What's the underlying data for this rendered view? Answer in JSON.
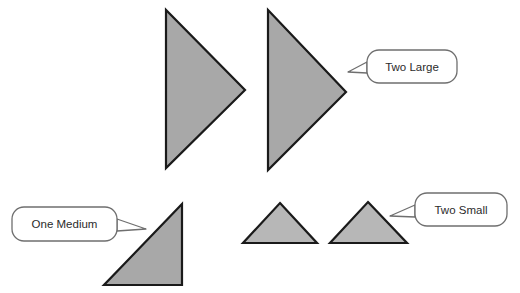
{
  "canvas": {
    "width": 520,
    "height": 293,
    "background": "#ffffff"
  },
  "colors": {
    "shape_fill_large": "#a8a8a8",
    "shape_fill_medium": "#a8a8a8",
    "shape_fill_small": "#b7b7b7",
    "shape_stroke": "#1a1a1a",
    "callout_fill": "#ffffff",
    "callout_stroke": "#6f6f6f",
    "callout_text": "#2b2b2b",
    "cropped_header_text": "#c9c9cf"
  },
  "header": {
    "cropped_text": ""
  },
  "shapes": [
    {
      "id": "large-triangle-1",
      "label": "Large right-pointing triangle (first)",
      "orientation": "points-right",
      "size_class": "large",
      "points": "166,10 166,168 245,90",
      "fill": "#a8a8a8"
    },
    {
      "id": "large-triangle-2",
      "label": "Large right-pointing triangle (second)",
      "orientation": "points-right",
      "size_class": "large",
      "points": "268,10 268,170 346,92",
      "fill": "#a8a8a8"
    },
    {
      "id": "medium-triangle-1",
      "label": "Medium right triangle",
      "orientation": "right-angle-bottom-right",
      "size_class": "medium",
      "points": "182,204 182,285 104,285",
      "fill": "#a8a8a8"
    },
    {
      "id": "small-triangle-1",
      "label": "Small upward triangle (first)",
      "orientation": "points-up",
      "size_class": "small",
      "points": "280,203 317,243 243,243",
      "fill": "#b7b7b7"
    },
    {
      "id": "small-triangle-2",
      "label": "Small upward triangle (second)",
      "orientation": "points-up",
      "size_class": "small",
      "points": "368,202 407,243 330,243",
      "fill": "#b7b7b7"
    }
  ],
  "callouts": [
    {
      "id": "callout-two-large",
      "text": "Two Large",
      "box": {
        "x": 367,
        "y": 50,
        "width": 90,
        "height": 33,
        "rx": 12
      },
      "tail": "367,62 348,72 367,73",
      "points_to": "large-triangle-2"
    },
    {
      "id": "callout-one-medium",
      "text": "One Medium",
      "box": {
        "x": 12,
        "y": 207,
        "width": 105,
        "height": 34,
        "rx": 12
      },
      "tail": "117,219 146,229 117,231",
      "points_to": "medium-triangle-1"
    },
    {
      "id": "callout-two-small",
      "text": "Two Small",
      "box": {
        "x": 415,
        "y": 193,
        "width": 92,
        "height": 33,
        "rx": 12
      },
      "tail": "415,205 390,216 415,217",
      "points_to": "small-triangle-2"
    }
  ]
}
